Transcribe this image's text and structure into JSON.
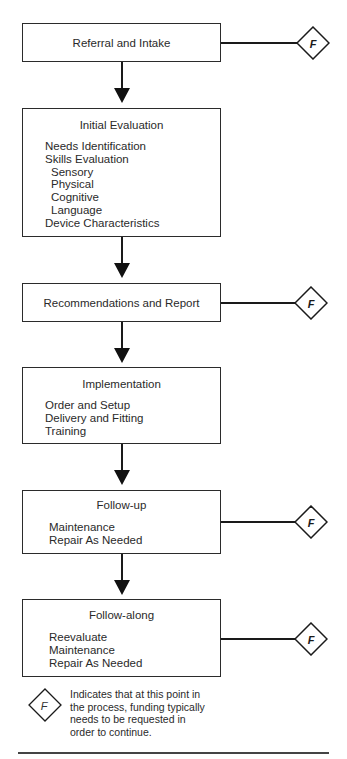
{
  "diagram": {
    "type": "flowchart",
    "steps": [
      {
        "title": "Referral and Intake",
        "items": [],
        "funding_point": true
      },
      {
        "title": "Initial Evaluation",
        "items": [
          {
            "label": "Needs Identification",
            "level": 0
          },
          {
            "label": "Skills Evaluation",
            "level": 0
          },
          {
            "label": "Sensory",
            "level": 1
          },
          {
            "label": "Physical",
            "level": 1
          },
          {
            "label": "Cognitive",
            "level": 1
          },
          {
            "label": "Language",
            "level": 1
          },
          {
            "label": "Device Characteristics",
            "level": 0
          }
        ],
        "funding_point": false
      },
      {
        "title": "Recommendations and Report",
        "items": [],
        "funding_point": true
      },
      {
        "title": "Implementation",
        "items": [
          {
            "label": "Order and Setup",
            "level": 0
          },
          {
            "label": "Delivery and Fitting",
            "level": 0
          },
          {
            "label": "Training",
            "level": 0
          }
        ],
        "funding_point": false
      },
      {
        "title": "Follow-up",
        "items": [
          {
            "label": "Maintenance",
            "level": 0
          },
          {
            "label": "Repair As Needed",
            "level": 0
          }
        ],
        "funding_point": true
      },
      {
        "title": "Follow-along",
        "items": [
          {
            "label": "Reevaluate",
            "level": 0
          },
          {
            "label": "Maintenance",
            "level": 0
          },
          {
            "label": "Repair As Needed",
            "level": 0
          }
        ],
        "funding_point": true
      }
    ],
    "funding_marker": "F",
    "legend": {
      "symbol": "F",
      "lines": [
        "Indicates that at this point in",
        "the process, funding typically",
        "needs to be requested in",
        "order to continue."
      ]
    },
    "colors": {
      "line": "#1a1a1a",
      "box_border": "#2b2b2b",
      "text": "#2a2a2a",
      "background": "#ffffff"
    }
  }
}
